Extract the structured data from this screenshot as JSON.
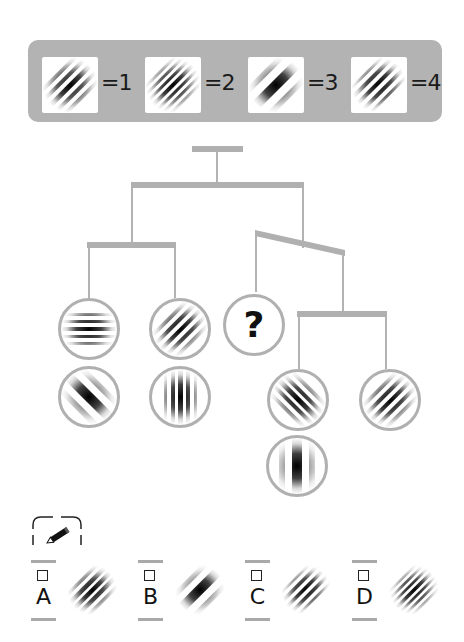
{
  "legend": {
    "items": [
      {
        "pattern": "gabor-medium-freq-diagonal",
        "label": "=1"
      },
      {
        "pattern": "gabor-high-freq-diagonal",
        "label": "=2"
      },
      {
        "pattern": "gabor-low-freq-diagonal",
        "label": "=3"
      },
      {
        "pattern": "gabor-medium-high-freq-diagonal",
        "label": "=4"
      }
    ]
  },
  "tree": {
    "nodes": [
      {
        "id": "leaf-1",
        "pattern": "gabor-horizontal"
      },
      {
        "id": "leaf-2",
        "pattern": "gabor-low-freq-antidiagonal"
      },
      {
        "id": "leaf-3",
        "pattern": "gabor-medium-freq-diagonal"
      },
      {
        "id": "leaf-4",
        "pattern": "gabor-vertical-medium"
      },
      {
        "id": "leaf-unknown",
        "label": "?"
      },
      {
        "id": "leaf-5",
        "pattern": "gabor-medium-antidiagonal"
      },
      {
        "id": "leaf-6",
        "pattern": "gabor-vertical-low"
      },
      {
        "id": "leaf-7",
        "pattern": "gabor-medium-freq-diagonal"
      }
    ]
  },
  "answer": {
    "icon": "pencil-icon",
    "options": [
      {
        "letter": "A",
        "pattern": "gabor-medium-freq-diagonal"
      },
      {
        "letter": "B",
        "pattern": "gabor-low-freq-diagonal"
      },
      {
        "letter": "C",
        "pattern": "gabor-medium-high-freq-diagonal"
      },
      {
        "letter": "D",
        "pattern": "gabor-high-freq-diagonal"
      }
    ]
  },
  "colors": {
    "panel": "#b3b3b3",
    "connector": "#b0b0b0",
    "ink": "#111111"
  }
}
